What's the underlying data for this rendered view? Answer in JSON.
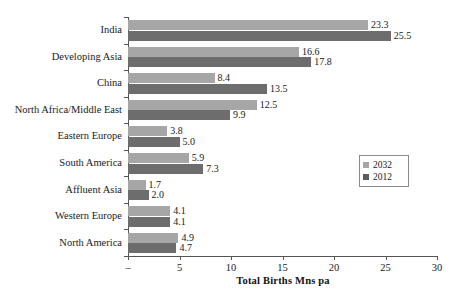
{
  "chart_data": {
    "type": "bar",
    "orientation": "horizontal",
    "title": "",
    "xlabel": "Total Births Mns pa",
    "ylabel": "",
    "xlim": [
      0,
      30
    ],
    "xticks": [
      0,
      5,
      10,
      15,
      20,
      25,
      30
    ],
    "xtick_labels": [
      "–",
      "5",
      "10",
      "15",
      "20",
      "25",
      "30"
    ],
    "grid": false,
    "legend_position": "right-middle",
    "categories": [
      "India",
      "Developing Asia",
      "China",
      "North Africa/Middle East",
      "Eastern Europe",
      "South America",
      "Affluent Asia",
      "Western Europe",
      "North America"
    ],
    "series": [
      {
        "name": "2032",
        "color": "#a6a6a6",
        "values": [
          23.3,
          16.6,
          8.4,
          12.5,
          3.8,
          5.9,
          1.7,
          4.1,
          4.9
        ],
        "labels": [
          "23.3",
          "16.6",
          "8.4",
          "12.5",
          "3.8",
          "5.9",
          "1.7",
          "4.1",
          "4.9"
        ]
      },
      {
        "name": "2012",
        "color": "#6d6d6d",
        "values": [
          25.5,
          17.8,
          13.5,
          9.9,
          5.0,
          7.3,
          2.0,
          4.1,
          4.7
        ],
        "labels": [
          "25.5",
          "17.8",
          "13.5",
          "9.9",
          "5.0",
          "7.3",
          "2.0",
          "4.1",
          "4.7"
        ]
      }
    ]
  },
  "legend": {
    "entries": [
      {
        "label": "2032",
        "color": "#a6a6a6"
      },
      {
        "label": "2012",
        "color": "#5d5d5d"
      }
    ]
  },
  "axis": {
    "x_title": "Total Births Mns pa"
  }
}
